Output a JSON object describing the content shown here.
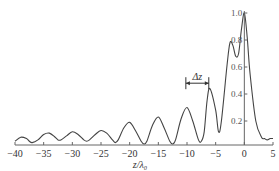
{
  "chart_data": {
    "type": "line",
    "title": "",
    "xlabel": "z/λ₀",
    "ylabel": "",
    "xlim": [
      -40,
      5
    ],
    "ylim": [
      0,
      1.0
    ],
    "x_ticks": [
      -40,
      -35,
      -30,
      -25,
      -20,
      -15,
      -10,
      -5,
      0,
      5
    ],
    "x_tick_labels": [
      "−40",
      "−35",
      "−30",
      "−25",
      "−20",
      "−15",
      "−10",
      "−5",
      "0",
      "5"
    ],
    "y_ticks": [
      0.2,
      0.4,
      0.6,
      0.8,
      1.0
    ],
    "y_tick_labels": [
      "0.2",
      "0.4",
      "0.6",
      "0.8",
      "1.0"
    ],
    "annotation": {
      "text": "Δz",
      "from_x": -10.2,
      "to_x": -6.2,
      "y": 0.48
    },
    "series": [
      {
        "name": "intensity",
        "x": [
          -40,
          -39,
          -38,
          -37.5,
          -37,
          -36,
          -35,
          -34,
          -33,
          -32.5,
          -32,
          -31,
          -30,
          -29,
          -28,
          -27.5,
          -27,
          -26,
          -25,
          -24,
          -23,
          -22.5,
          -22,
          -21,
          -20,
          -19,
          -18,
          -17.5,
          -17,
          -16,
          -15,
          -14,
          -13,
          -12.5,
          -12,
          -11,
          -10,
          -9,
          -8,
          -7.5,
          -7,
          -6.5,
          -6,
          -5,
          -4.5,
          -4,
          -3,
          -2.5,
          -2,
          -1.5,
          -1,
          -0.5,
          0,
          0.5,
          1,
          2,
          3,
          3.5,
          4,
          4.5,
          5
        ],
        "y": [
          0.05,
          0.08,
          0.07,
          0.05,
          0.04,
          0.06,
          0.1,
          0.11,
          0.08,
          0.06,
          0.06,
          0.09,
          0.12,
          0.1,
          0.06,
          0.05,
          0.06,
          0.1,
          0.13,
          0.11,
          0.06,
          0.04,
          0.06,
          0.15,
          0.19,
          0.13,
          0.05,
          0.03,
          0.05,
          0.17,
          0.23,
          0.15,
          0.05,
          0.03,
          0.06,
          0.22,
          0.3,
          0.2,
          0.06,
          0.05,
          0.12,
          0.35,
          0.44,
          0.28,
          0.12,
          0.2,
          0.62,
          0.78,
          0.76,
          0.68,
          0.7,
          0.88,
          1.0,
          0.82,
          0.55,
          0.2,
          0.08,
          0.07,
          0.06,
          0.07,
          0.07
        ]
      }
    ]
  }
}
